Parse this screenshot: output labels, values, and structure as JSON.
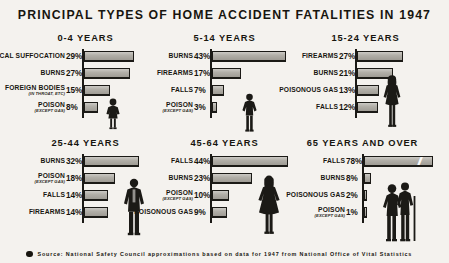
{
  "title": "PRINCIPAL TYPES OF HOME ACCIDENT FATALITIES IN 1947",
  "footer": {
    "bullet": "bullet-dot",
    "source": "Source: National Safety Council approximations based on data for 1947 from National Office of Vital Statistics"
  },
  "colors": {
    "background": "#f4f2ee",
    "ink": "#17150f",
    "bar_fill": "#a9a69e",
    "bar_outline": "#1b1a16"
  },
  "chart_data": {
    "type": "bar",
    "title": "PRINCIPAL TYPES OF HOME ACCIDENT FATALITIES IN 1947",
    "xlabel": "",
    "ylabel": "",
    "grid": false,
    "legend": "none",
    "orientation": "horizontal",
    "value_unit": "percent",
    "xlim": [
      0,
      78
    ],
    "note": "Longest bar (65 years and over, Falls 78%) drawn with an axis-break mark.",
    "panels": [
      {
        "group": "0-4 YEARS",
        "figure": "child-girl-figure",
        "categories": [
          "MECHANICAL SUFFOCATION",
          "BURNS",
          "FOREIGN BODIES",
          "POISON"
        ],
        "sublabels": [
          "",
          "",
          "(IN THROAT, ETC)",
          "(EXCEPT GAS)"
        ],
        "values": [
          29,
          27,
          15,
          8
        ],
        "value_labels": [
          "29%",
          "27%",
          "15%",
          "8%"
        ]
      },
      {
        "group": "5-14 YEARS",
        "figure": "child-boy-figure",
        "categories": [
          "BURNS",
          "FIREARMS",
          "FALLS",
          "POISON"
        ],
        "sublabels": [
          "",
          "",
          "",
          "(EXCEPT GAS)"
        ],
        "values": [
          43,
          17,
          7,
          3
        ],
        "value_labels": [
          "43%",
          "17%",
          "7%",
          "3%"
        ]
      },
      {
        "group": "15-24 YEARS",
        "figure": "young-woman-figure",
        "categories": [
          "FIREARMS",
          "BURNS",
          "POISONOUS GAS",
          "FALLS"
        ],
        "sublabels": [
          "",
          "",
          "",
          ""
        ],
        "values": [
          27,
          21,
          13,
          12
        ],
        "value_labels": [
          "27%",
          "21%",
          "13%",
          "12%"
        ]
      },
      {
        "group": "25-44 YEARS",
        "figure": "adult-man-figure",
        "categories": [
          "BURNS",
          "POISON",
          "FALLS",
          "FIREARMS"
        ],
        "sublabels": [
          "",
          "(EXCEPT GAS)",
          "",
          ""
        ],
        "values": [
          32,
          18,
          14,
          14
        ],
        "value_labels": [
          "32%",
          "18%",
          "14%",
          "14%"
        ]
      },
      {
        "group": "45-64 YEARS",
        "figure": "middle-aged-woman-figure",
        "categories": [
          "FALLS",
          "BURNS",
          "POISON",
          "POISONOUS GAS"
        ],
        "sublabels": [
          "",
          "",
          "(EXCEPT GAS)",
          ""
        ],
        "values": [
          44,
          23,
          10,
          9
        ],
        "value_labels": [
          "44%",
          "23%",
          "10%",
          "9%"
        ]
      },
      {
        "group": "65 YEARS AND OVER",
        "figure": "elderly-with-cane-figure",
        "categories": [
          "FALLS",
          "BURNS",
          "POISONOUS GAS",
          "POISON"
        ],
        "sublabels": [
          "",
          "",
          "",
          "(EXCEPT GAS)"
        ],
        "values": [
          78,
          8,
          2,
          1
        ],
        "value_labels": [
          "78%",
          "8%",
          "2%",
          "1%"
        ]
      }
    ]
  }
}
